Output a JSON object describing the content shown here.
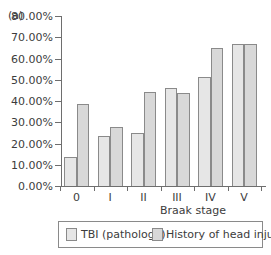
{
  "chart_data": {
    "type": "bar",
    "panel_label": "(a)",
    "title": "",
    "xlabel": "Braak stage",
    "ylabel": "",
    "categories": [
      "0",
      "I",
      "II",
      "III",
      "IV",
      "V"
    ],
    "series": [
      {
        "name": "TBI (pathology)",
        "values": [
          13.7,
          23.5,
          24.9,
          46.3,
          51.2,
          66.7
        ],
        "color": "#e6e6e6"
      },
      {
        "name": "History of head injury",
        "values": [
          38.6,
          27.8,
          44.2,
          44.0,
          65.1,
          66.7
        ],
        "color": "#d8d8d8"
      }
    ],
    "ylim": [
      0,
      80
    ],
    "yticks": [
      "0.00%",
      "10.00%",
      "20.00%",
      "30.00%",
      "40.00%",
      "50.00%",
      "60.00%",
      "70.00%",
      "80.00%"
    ],
    "grid": false,
    "legend_position": "bottom"
  },
  "legend": {
    "items": [
      {
        "label": "TBI (pathology)"
      },
      {
        "label": "History of head injury"
      }
    ]
  }
}
